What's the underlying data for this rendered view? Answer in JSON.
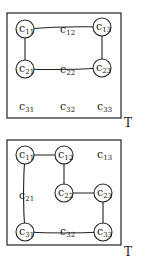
{
  "diagrams": [
    {
      "label": "T",
      "box": {
        "x": 7,
        "y": 13,
        "w": 114,
        "h": 105
      },
      "label_pos": {
        "x": 124,
        "y": 127
      },
      "cells": [
        {
          "id": "c11",
          "base": "c",
          "sub": "11",
          "x": 25,
          "y": 29,
          "circled": true
        },
        {
          "id": "c12",
          "base": "c",
          "sub": "12",
          "x": 66,
          "y": 30,
          "circled": false
        },
        {
          "id": "c13",
          "base": "c",
          "sub": "13",
          "x": 102,
          "y": 27,
          "circled": true
        },
        {
          "id": "c21",
          "base": "c",
          "sub": "21",
          "x": 25,
          "y": 69,
          "circled": true
        },
        {
          "id": "c22",
          "base": "c",
          "sub": "22",
          "x": 66,
          "y": 70,
          "circled": false
        },
        {
          "id": "c23",
          "base": "c",
          "sub": "23",
          "x": 102,
          "y": 68,
          "circled": true
        },
        {
          "id": "c31",
          "base": "c",
          "sub": "31",
          "x": 25,
          "y": 107,
          "circled": false
        },
        {
          "id": "c32",
          "base": "c",
          "sub": "32",
          "x": 66,
          "y": 107,
          "circled": false
        },
        {
          "id": "c33",
          "base": "c",
          "sub": "33",
          "x": 103,
          "y": 107,
          "circled": false
        }
      ],
      "edges": [
        {
          "from": "c11",
          "to": "c13",
          "curve": true
        },
        {
          "from": "c11",
          "to": "c21",
          "curve": false
        },
        {
          "from": "c13",
          "to": "c23",
          "curve": false
        },
        {
          "from": "c21",
          "to": "c23",
          "curve": true
        }
      ]
    },
    {
      "label": "T",
      "box": {
        "x": 7,
        "y": 140,
        "w": 114,
        "h": 105
      },
      "label_pos": {
        "x": 124,
        "y": 256
      },
      "cells": [
        {
          "id": "c11",
          "base": "c",
          "sub": "11",
          "x": 25,
          "y": 155,
          "circled": true
        },
        {
          "id": "c12",
          "base": "c",
          "sub": "12",
          "x": 64,
          "y": 155,
          "circled": true
        },
        {
          "id": "c13",
          "base": "c",
          "sub": "13",
          "x": 103,
          "y": 155,
          "circled": false
        },
        {
          "id": "c21",
          "base": "c",
          "sub": "21",
          "x": 25,
          "y": 196,
          "circled": false
        },
        {
          "id": "c22",
          "base": "c",
          "sub": "22",
          "x": 64,
          "y": 193,
          "circled": true
        },
        {
          "id": "c23",
          "base": "c",
          "sub": "23",
          "x": 103,
          "y": 193,
          "circled": true
        },
        {
          "id": "c31",
          "base": "c",
          "sub": "31",
          "x": 25,
          "y": 232,
          "circled": true
        },
        {
          "id": "c32",
          "base": "c",
          "sub": "32",
          "x": 66,
          "y": 232,
          "circled": false
        },
        {
          "id": "c33",
          "base": "c",
          "sub": "33",
          "x": 103,
          "y": 232,
          "circled": true
        }
      ],
      "edges": [
        {
          "from": "c11",
          "to": "c12",
          "curve": false
        },
        {
          "from": "c12",
          "to": "c22",
          "curve": false
        },
        {
          "from": "c22",
          "to": "c23",
          "curve": false
        },
        {
          "from": "c23",
          "to": "c33",
          "curve": false
        },
        {
          "from": "c11",
          "to": "c31",
          "curve": true
        },
        {
          "from": "c31",
          "to": "c33",
          "curve": true
        }
      ]
    }
  ]
}
